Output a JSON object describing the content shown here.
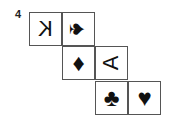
{
  "problem": {
    "number": "4"
  },
  "cells": [
    {
      "id": "r1c1",
      "content": "K",
      "orientation": "mirrored"
    },
    {
      "id": "r1c2",
      "content": "♠",
      "orientation": "rotated-90-cw",
      "suit": "spade"
    },
    {
      "id": "r2c1",
      "content": "♦",
      "orientation": "upright",
      "suit": "diamond"
    },
    {
      "id": "r2c2",
      "content": "A",
      "orientation": "rotated-90-ccw"
    },
    {
      "id": "r3c1",
      "content": "♣",
      "orientation": "upright",
      "suit": "club"
    },
    {
      "id": "r3c2",
      "content": "♥",
      "orientation": "upright",
      "suit": "heart"
    }
  ]
}
